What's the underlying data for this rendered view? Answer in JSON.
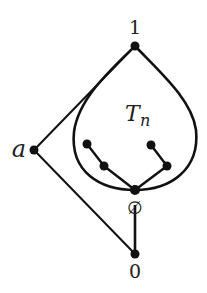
{
  "diagram": {
    "labels": {
      "top": "1",
      "left": "a",
      "tree_main": "T",
      "tree_sub": "n",
      "empty": "∅",
      "bottom": "0"
    },
    "nodes": [
      {
        "id": "one",
        "label": "1",
        "x": 135,
        "y": 46
      },
      {
        "id": "a",
        "label": "a",
        "x": 34,
        "y": 150
      },
      {
        "id": "tl",
        "label": "",
        "x": 87,
        "y": 144
      },
      {
        "id": "lm",
        "label": "",
        "x": 104,
        "y": 166
      },
      {
        "id": "tr",
        "label": "",
        "x": 151,
        "y": 145
      },
      {
        "id": "rm",
        "label": "",
        "x": 167,
        "y": 166
      },
      {
        "id": "empty",
        "label": "∅",
        "x": 135,
        "y": 190
      },
      {
        "id": "zero",
        "label": "0",
        "x": 135,
        "y": 254
      }
    ],
    "edges": [
      [
        "one",
        "a"
      ],
      [
        "a",
        "zero"
      ],
      [
        "empty",
        "zero"
      ],
      [
        "tl",
        "lm"
      ],
      [
        "lm",
        "empty"
      ],
      [
        "tr",
        "rm"
      ],
      [
        "rm",
        "empty"
      ]
    ],
    "colors": {
      "stroke": "#111111",
      "node": "#111111"
    }
  }
}
